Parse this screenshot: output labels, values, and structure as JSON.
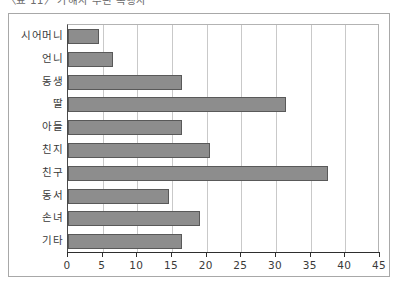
{
  "caption": {
    "text": "〈표 11〉 가해자 주된 폭행자"
  },
  "chart_data": {
    "type": "bar",
    "orientation": "horizontal",
    "title": "",
    "xlabel": "",
    "ylabel": "",
    "categories": [
      "시어머니",
      "언니",
      "동생",
      "딸",
      "아들",
      "친지",
      "친구",
      "동서",
      "손녀",
      "기타"
    ],
    "values": [
      4.5,
      6.5,
      16.5,
      31.5,
      16.5,
      20.5,
      37.5,
      14.5,
      19,
      16.5
    ],
    "xlim": [
      0,
      45
    ],
    "xticks": [
      0,
      5,
      10,
      15,
      20,
      25,
      30,
      35,
      40,
      45
    ],
    "xtick_labels": [
      "0",
      "5",
      "10",
      "15",
      "20",
      "25",
      "30",
      "35",
      "40",
      "45"
    ],
    "grid": "vertical",
    "legend": "none",
    "bar_color": "#8d8d8d",
    "bar_border_color": "#595959",
    "gridline_color": "#c9c9c9",
    "axis_color": "#2e2e2e",
    "frame_color": "#a8a8a8",
    "background": "#ffffff"
  }
}
